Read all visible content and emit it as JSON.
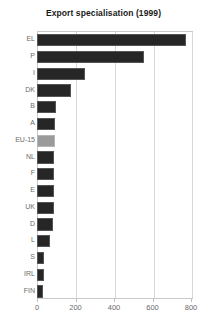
{
  "chart_data": {
    "type": "bar",
    "orientation": "horizontal",
    "title": "Export specialisation (1999)",
    "xlabel": "",
    "ylabel": "",
    "categories": [
      "EL",
      "P",
      "I",
      "DK",
      "B",
      "A",
      "EU-15",
      "NL",
      "F",
      "E",
      "UK",
      "D",
      "L",
      "S",
      "IRL",
      "FIN"
    ],
    "values": [
      775,
      558,
      251,
      179,
      98,
      96,
      93,
      90,
      89,
      88,
      86,
      84,
      68,
      38,
      34,
      31
    ],
    "highlight_category": "EU-15",
    "xlim": [
      0,
      800
    ],
    "xticks": [
      0,
      200,
      400,
      600,
      800
    ],
    "xtick_labels": [
      "0",
      "200",
      "400",
      "600",
      "800"
    ],
    "grid": "vertical",
    "legend": null,
    "bar_color": "#262626",
    "highlight_color": "#9a9a9a",
    "grid_color": "#d8d8d8",
    "axis_color": "#c9c9c9",
    "text_color": "#6b6b6b",
    "title_color": "#1a1a1a"
  }
}
